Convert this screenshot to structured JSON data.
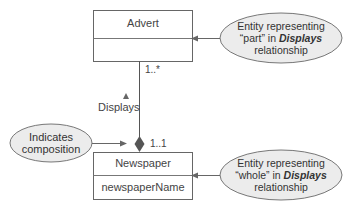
{
  "diagram": {
    "type": "UML class diagram - composition",
    "classes": [
      {
        "name": "Advert",
        "attributes": []
      },
      {
        "name": "Newspaper",
        "attributes": [
          "newspaperName"
        ]
      }
    ],
    "association": {
      "name": "Displays",
      "direction_marker": "▲",
      "advert_multiplicity": "1..*",
      "newspaper_multiplicity": "1..1",
      "type": "composition"
    },
    "notes": {
      "part": {
        "line1": "Entity representing",
        "line2_pre": "“part” in ",
        "line2_em": "Displays",
        "line3": "relationship"
      },
      "whole": {
        "line1": "Entity representing",
        "line2_pre": "“whole” in ",
        "line2_em": "Displays",
        "line3": "relationship"
      },
      "composition": {
        "line1": "Indicates",
        "line2": "composition"
      }
    },
    "colors": {
      "line": "#666666",
      "ellipse_fill": "#ececec",
      "diamond": "#555555"
    }
  }
}
